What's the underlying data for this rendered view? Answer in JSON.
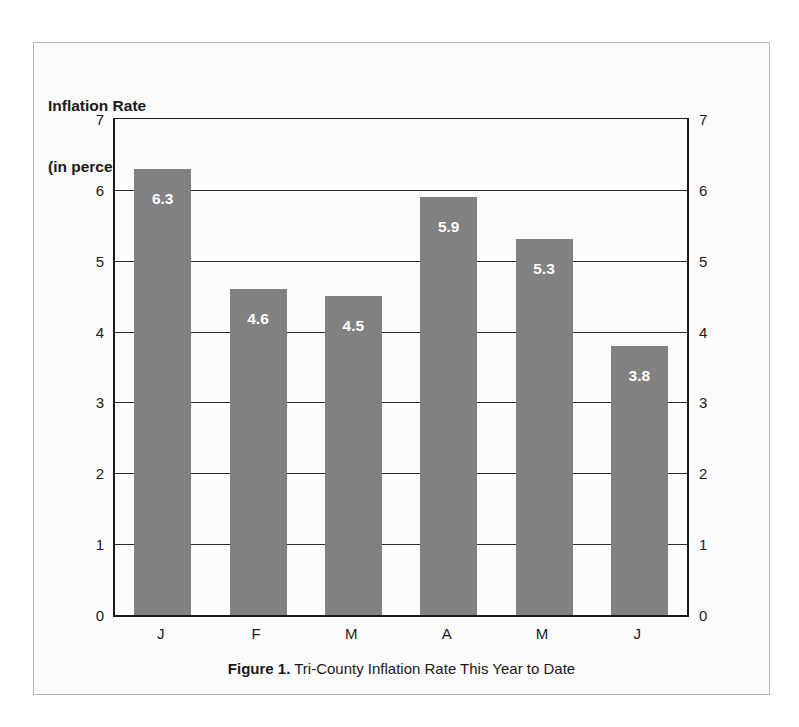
{
  "chart_data": {
    "type": "bar",
    "title": "Inflation Rate\n(in percent)",
    "title_line1": "Inflation Rate",
    "title_line2": "(in percent)",
    "categories": [
      "J",
      "F",
      "M",
      "A",
      "M",
      "J"
    ],
    "values": [
      6.3,
      4.6,
      4.5,
      5.9,
      5.3,
      3.8
    ],
    "value_labels": [
      "6.3",
      "4.6",
      "4.5",
      "5.9",
      "5.3",
      "3.8"
    ],
    "xlabel": "",
    "ylabel": "Inflation Rate (in percent)",
    "ylim": [
      0,
      7
    ],
    "yticks": [
      0,
      1,
      2,
      3,
      4,
      5,
      6,
      7
    ],
    "ytick_labels": [
      "0",
      "1",
      "2",
      "3",
      "4",
      "5",
      "6",
      "7"
    ],
    "ytick_labels_right": [
      "0",
      "1",
      "2",
      "3",
      "4",
      "5",
      "6",
      "7"
    ],
    "grid": true,
    "legend": false,
    "bar_color": "#818181",
    "value_label_color": "#ffffff",
    "axis_color": "#1a1a1a",
    "plot_background": "#fcfcfc"
  },
  "caption": {
    "label": "Figure 1.",
    "text": " Tri-County Inflation Rate This Year to Date"
  }
}
